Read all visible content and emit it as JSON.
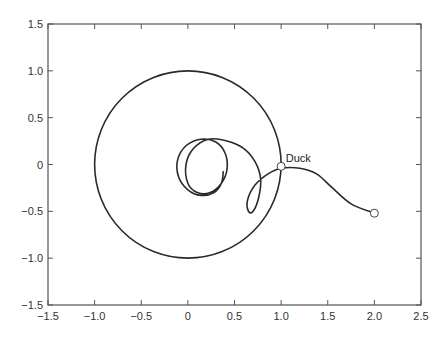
{
  "chart_data": {
    "type": "line",
    "title": "",
    "xlabel": "",
    "ylabel": "",
    "xlim": [
      -1.5,
      2.5
    ],
    "ylim": [
      -1.5,
      1.5
    ],
    "grid": false,
    "legend": null,
    "xticks": [
      "-1.5",
      "-1.0",
      "-0.5",
      "0",
      "0.5",
      "1.0",
      "1.5",
      "2.0",
      "2.5"
    ],
    "yticks": [
      "1.5",
      "1.0",
      "0.5",
      "0",
      "-0.5",
      "-1.0",
      "-1.5"
    ],
    "series": [
      {
        "name": "unit-circle",
        "shape": "circle",
        "center": [
          0,
          0
        ],
        "radius": 1.0,
        "color": "#2a2a2a"
      },
      {
        "name": "duck-path",
        "color": "#2a2a2a",
        "points": [
          [
            0.38,
            -0.07
          ],
          [
            0.36,
            -0.2
          ],
          [
            0.28,
            -0.3
          ],
          [
            0.14,
            -0.33
          ],
          [
            0.0,
            -0.27
          ],
          [
            -0.1,
            -0.13
          ],
          [
            -0.11,
            0.05
          ],
          [
            -0.02,
            0.2
          ],
          [
            0.14,
            0.27
          ],
          [
            0.3,
            0.24
          ],
          [
            0.4,
            0.12
          ],
          [
            0.42,
            -0.05
          ],
          [
            0.36,
            -0.2
          ],
          [
            0.24,
            -0.3
          ],
          [
            0.1,
            -0.3
          ],
          [
            0.0,
            -0.2
          ],
          [
            -0.02,
            0.0
          ],
          [
            0.06,
            0.17
          ],
          [
            0.22,
            0.27
          ],
          [
            0.42,
            0.25
          ],
          [
            0.6,
            0.17
          ],
          [
            0.72,
            0.03
          ],
          [
            0.78,
            -0.15
          ],
          [
            0.76,
            -0.35
          ],
          [
            0.7,
            -0.5
          ],
          [
            0.65,
            -0.5
          ],
          [
            0.64,
            -0.38
          ],
          [
            0.72,
            -0.22
          ],
          [
            0.86,
            -0.1
          ],
          [
            1.0,
            -0.04
          ],
          [
            1.2,
            -0.04
          ],
          [
            1.38,
            -0.1
          ],
          [
            1.55,
            -0.25
          ],
          [
            1.75,
            -0.42
          ],
          [
            2.0,
            -0.52
          ]
        ]
      }
    ],
    "markers": [
      {
        "name": "duck-marker",
        "x": 1.0,
        "y": -0.02,
        "label": "Duck",
        "shape": "open-circle"
      },
      {
        "name": "end-marker",
        "x": 2.0,
        "y": -0.52,
        "label": "",
        "shape": "open-circle"
      }
    ],
    "annotations": [
      {
        "text": "Duck",
        "x": 1.05,
        "y": 0.05
      }
    ]
  },
  "plot": {
    "annotation_text": "Duck",
    "line_color": "#2a2a2a",
    "axis_color": "#555555"
  }
}
